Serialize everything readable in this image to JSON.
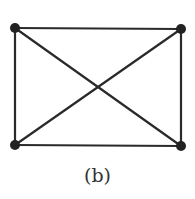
{
  "diagram": {
    "caption": "(b)",
    "edge_color": "#2a2a2a",
    "vertices": [
      {
        "id": "top-left",
        "x": 15,
        "y": 28
      },
      {
        "id": "top-right",
        "x": 181,
        "y": 29
      },
      {
        "id": "bottom-left",
        "x": 15,
        "y": 145
      },
      {
        "id": "bottom-right",
        "x": 181,
        "y": 146
      }
    ],
    "edges": [
      [
        "top-left",
        "top-right"
      ],
      [
        "top-right",
        "bottom-right"
      ],
      [
        "bottom-right",
        "bottom-left"
      ],
      [
        "bottom-left",
        "top-left"
      ],
      [
        "top-left",
        "bottom-right"
      ],
      [
        "top-right",
        "bottom-left"
      ]
    ]
  }
}
